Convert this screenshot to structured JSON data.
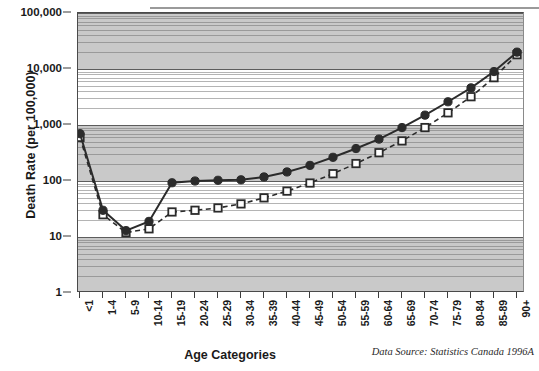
{
  "chart_data": {
    "type": "line",
    "title": "",
    "xlabel": "Age Categories",
    "ylabel": "Death Rate (per 100,000)",
    "yscale": "log",
    "ylim": [
      1,
      100000
    ],
    "ytick_labels": [
      "100,000",
      "10,000",
      "1,000",
      "100",
      "10",
      "1"
    ],
    "ytick_values": [
      100000,
      10000,
      1000,
      100,
      10,
      1
    ],
    "grid": "major and minor horizontal, alternating shaded decade bands",
    "legend": "none shown",
    "annotation": "Data Source: Statistics Canada 1996A",
    "categories": [
      "<1",
      "1-4",
      "5-9",
      "10-14",
      "15-19",
      "20-24",
      "25-29",
      "30-34",
      "35-39",
      "40-44",
      "45-49",
      "50-54",
      "55-59",
      "60-64",
      "65-69",
      "70-74",
      "75-79",
      "80-84",
      "85-89",
      "90+"
    ],
    "series": [
      {
        "name": "solid-circle-series",
        "marker": "filled-circle",
        "linestyle": "solid",
        "color": "#2b2b2b",
        "values": [
          700,
          30,
          13,
          19,
          93,
          100,
          103,
          105,
          118,
          145,
          190,
          265,
          380,
          560,
          900,
          1500,
          2600,
          4600,
          9000,
          20000
        ]
      },
      {
        "name": "dashed-square-series",
        "marker": "open-square",
        "linestyle": "dashed",
        "color": "#2b2b2b",
        "values": [
          600,
          25,
          12,
          14,
          28,
          30,
          33,
          39,
          50,
          66,
          92,
          135,
          205,
          320,
          520,
          900,
          1650,
          3200,
          7000,
          18000
        ]
      }
    ]
  },
  "axes": {
    "ytitle": "Death Rate (per 100,000)",
    "xtitle": "Age Categories"
  },
  "footer": {
    "source": "Data Source: Statistics Canada 1996A"
  }
}
